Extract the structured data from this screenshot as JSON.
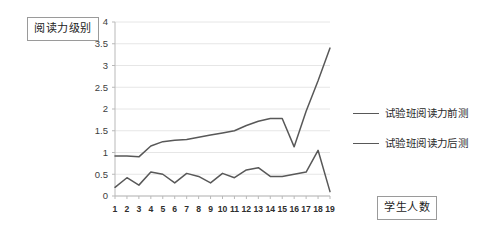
{
  "labels": {
    "y_axis_title": "阅读力级别",
    "x_axis_title": "学生人数"
  },
  "legend": {
    "position": "right",
    "items": [
      {
        "label": "试验班阅读力前测",
        "color": "#585858"
      },
      {
        "label": "试验班阅读力后测",
        "color": "#585858"
      }
    ]
  },
  "style": {
    "line_color": "#555555",
    "grid_color": "#e6e6e6",
    "axis_color": "#b9b9b9",
    "box_border": "#9a9a9a",
    "tick_label_color": "#3d3d3d"
  },
  "chart_data": {
    "type": "line",
    "title": "",
    "subtitle": "",
    "xlabel": "学生人数",
    "ylabel": "阅读力级别",
    "x": [
      1,
      2,
      3,
      4,
      5,
      6,
      7,
      8,
      9,
      10,
      11,
      12,
      13,
      14,
      15,
      16,
      17,
      18,
      19
    ],
    "xtick_labels": [
      "1",
      "2",
      "3",
      "4",
      "5",
      "6",
      "7",
      "8",
      "9",
      "10",
      "11",
      "12",
      "13",
      "14",
      "15",
      "16",
      "17",
      "18",
      "19"
    ],
    "ytick_labels": [
      "0",
      "0.5",
      "1",
      "1.5",
      "2",
      "2.5",
      "3",
      "3.5",
      "4"
    ],
    "yticks": [
      0,
      0.5,
      1,
      1.5,
      2,
      2.5,
      3,
      3.5,
      4
    ],
    "ylim": [
      0,
      4
    ],
    "grid": true,
    "grid_axis": "y",
    "series": [
      {
        "name": "试验班阅读力前测",
        "color": "#585858",
        "values": [
          0.2,
          0.42,
          0.25,
          0.55,
          0.5,
          0.3,
          0.52,
          0.45,
          0.3,
          0.52,
          0.42,
          0.6,
          0.65,
          0.45,
          0.45,
          0.5,
          0.55,
          1.05,
          0.1
        ]
      },
      {
        "name": "试验班阅读力后测",
        "color": "#585858",
        "values": [
          0.92,
          0.92,
          0.9,
          1.15,
          1.25,
          1.28,
          1.3,
          1.35,
          1.4,
          1.45,
          1.5,
          1.62,
          1.72,
          1.78,
          1.78,
          1.13,
          1.95,
          2.65,
          3.4
        ]
      }
    ]
  }
}
